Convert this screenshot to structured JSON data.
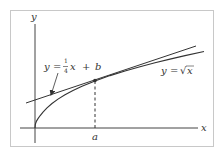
{
  "figure": {
    "axis_labels": {
      "x": "x",
      "y": "y"
    },
    "tick_label_a": "a",
    "tangent_label": {
      "lhs": "y",
      "eq": "=",
      "frac_num": "1",
      "frac_den": "4",
      "var": "x",
      "plus": "+",
      "const": "b"
    },
    "curve_label": {
      "lhs": "y",
      "eq": "=",
      "sqrt_symbol": "√",
      "var": "x"
    },
    "colors": {
      "frame": "#c8c8c8",
      "lines": "#333333",
      "background": "#ffffff"
    }
  }
}
